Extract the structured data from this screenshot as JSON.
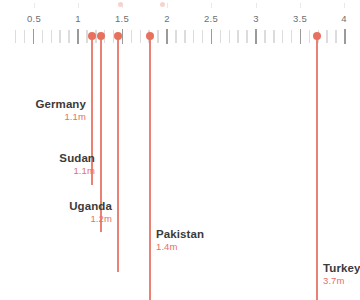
{
  "chart_data": {
    "type": "scatter",
    "title": "",
    "xlabel": "",
    "ylabel": "",
    "xlim": [
      0.3,
      4.05
    ],
    "grid": false,
    "legend": null,
    "axis": {
      "major_ticks": [
        0.5,
        1,
        1.5,
        2,
        2.5,
        3,
        3.5,
        4
      ],
      "tick_labels": [
        "0.5",
        "1",
        "1.5",
        "2",
        "2.5",
        "3",
        "3.5",
        "4"
      ],
      "minor_tick_step": 0.1
    },
    "categories": [
      "Germany",
      "Sudan",
      "Uganda",
      "Pakistan",
      "Turkey"
    ],
    "values": [
      1.1,
      1.1,
      1.2,
      1.4,
      3.7
    ],
    "value_labels": [
      "1.1m",
      "1.1m",
      "1.2m",
      "1.4m",
      "3.7m"
    ],
    "points": [
      {
        "name": "Germany",
        "value": 1.1,
        "value_label": "1.1m"
      },
      {
        "name": "Sudan",
        "value": 1.1,
        "value_label": "1.1m"
      },
      {
        "name": "Uganda",
        "value": 1.2,
        "value_label": "1.2m"
      },
      {
        "name": "Pakistan",
        "value": 1.4,
        "value_label": "1.4m"
      },
      {
        "name": "Turkey",
        "value": 3.7,
        "value_label": "3.7m"
      }
    ],
    "colors": {
      "marker": "#e8705f",
      "value_text": "#e8705f",
      "name_text": "#3b3b3b",
      "major_tick": "#9a9a9a",
      "minor_tick": "#dcdcdc",
      "axis_label": "#6f6f6f",
      "background": "#ffffff"
    }
  },
  "layout": {
    "marker_positions_px": [
      92,
      101,
      118,
      150,
      317
    ],
    "axis_tick_positions_px": [
      34,
      78,
      122,
      167,
      211,
      256,
      300,
      344
    ],
    "stem_bottoms_px": [
      185,
      232,
      272,
      300,
      300
    ],
    "annotation_tops_px": [
      98,
      152,
      200,
      228,
      262
    ]
  }
}
